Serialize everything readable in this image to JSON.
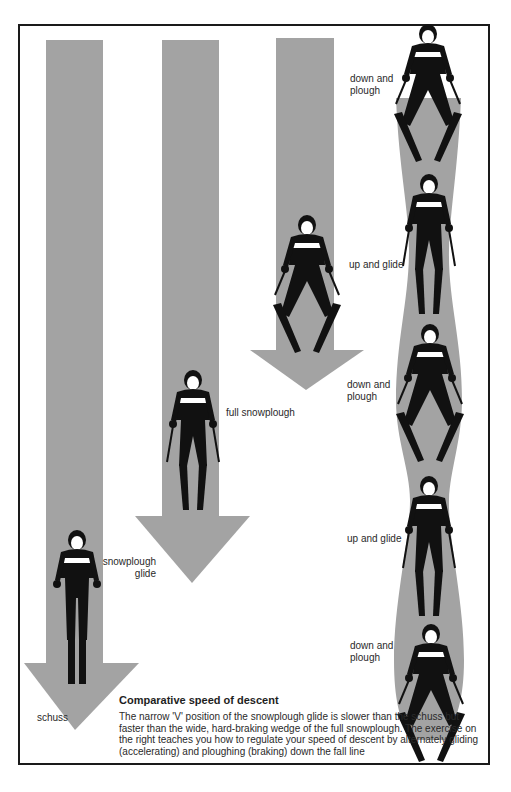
{
  "caption": {
    "title": "Comparative speed of descent",
    "body": "The narrow 'V' position of the snowplough glide is slower than the schuss but faster than the wide, hard-braking wedge of the full snowplough. The exercise on the right teaches you how to regulate your speed of descent by alternately gliding (accelerating) and ploughing (braking) down the fall line"
  },
  "arrows": [
    {
      "label": "schuss",
      "label_line2": ""
    },
    {
      "label": "snowplough",
      "label_line2": "glide"
    },
    {
      "label": "full snowplough",
      "label_line2": ""
    }
  ],
  "exercise_labels": [
    {
      "line1": "down and",
      "line2": "plough"
    },
    {
      "line1": "up and glide",
      "line2": ""
    },
    {
      "line1": "down and",
      "line2": "plough"
    },
    {
      "line1": "up and glide",
      "line2": ""
    },
    {
      "line1": "down and",
      "line2": "plough"
    }
  ],
  "colors": {
    "arrow_gray": "#a3a3a3",
    "figure": "#111111",
    "border": "#1a1a1a"
  }
}
